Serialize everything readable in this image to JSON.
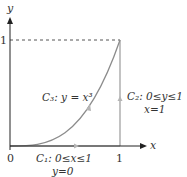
{
  "diagram": {
    "axes": {
      "x_label": "x",
      "y_label": "y",
      "origin_label": "0",
      "x_tick_label": "1",
      "y_tick_label": "1"
    },
    "curves": [
      {
        "id": "C1",
        "label": "C₁: 0≤x≤1",
        "sublabel": "y=0",
        "description": "segment along x-axis from (0,0) to (1,0)"
      },
      {
        "id": "C2",
        "label": "C₂: 0≤y≤1",
        "sublabel": "x=1",
        "description": "vertical segment from (1,0) to (1,1)"
      },
      {
        "id": "C3",
        "label": "C₃: y = x³",
        "description": "cubic curve from (0,0) to (1,1)"
      }
    ],
    "colors": {
      "axis": "#222222",
      "curve": "#8c8c8c",
      "dashed": "#555555",
      "arrow": "#b5b5b5"
    }
  }
}
